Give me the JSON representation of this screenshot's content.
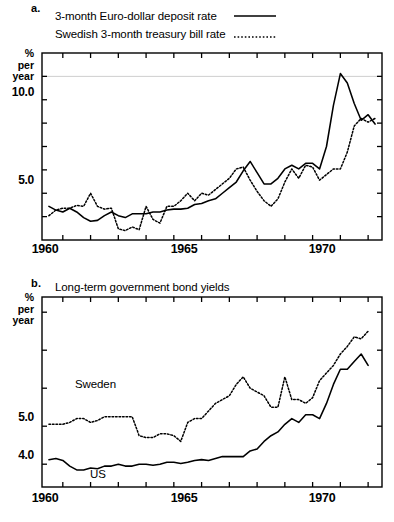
{
  "figure": {
    "panels": [
      {
        "letter": "a.",
        "axis_title_lines": [
          "%",
          "per",
          "year"
        ],
        "legend": [
          {
            "label": "3-month Euro-dollar deposit rate",
            "style": "solid"
          },
          {
            "label": "Swedish 3-month treasury bill rate",
            "style": "dotted"
          }
        ],
        "ytick_labels": [
          "10.0",
          "5.0"
        ],
        "xtick_labels": [
          "1960",
          "1965",
          "1970"
        ]
      },
      {
        "letter": "b.",
        "title": "Long-term government bond yields",
        "axis_title_lines": [
          "%",
          "per",
          "year"
        ],
        "annotations": [
          {
            "label": "Sweden"
          },
          {
            "label": "US"
          }
        ],
        "ytick_labels": [
          "5.0",
          "4.0"
        ],
        "xtick_labels": [
          "1960",
          "1965",
          "1970"
        ]
      }
    ]
  },
  "chart_data": [
    {
      "type": "line",
      "panel": "a",
      "title": "Short-term interest rates",
      "xlabel": "",
      "ylabel": "% per year",
      "xlim": [
        1959.25,
        1971.5
      ],
      "ylim": [
        2.5,
        12.5
      ],
      "yticks": [
        3.75,
        5.0,
        6.25,
        7.5,
        8.75,
        10.0,
        11.25
      ],
      "ytick_labels": {
        "10.0": 10.0,
        "5.0": 5.0
      },
      "xticks": [
        1960,
        1961,
        1962,
        1963,
        1964,
        1965,
        1966,
        1967,
        1968,
        1969,
        1970,
        1971
      ],
      "grid": "single horizontal gridline at 11.25",
      "legend_position": "above-plot",
      "series": [
        {
          "name": "3-month Euro-dollar deposit rate",
          "style": "solid",
          "x": [
            1959.5,
            1959.75,
            1960.0,
            1960.25,
            1960.5,
            1960.75,
            1961.0,
            1961.25,
            1961.5,
            1961.75,
            1962.0,
            1962.25,
            1962.5,
            1962.75,
            1963.0,
            1963.25,
            1963.5,
            1963.75,
            1964.0,
            1964.25,
            1964.5,
            1964.75,
            1965.0,
            1965.25,
            1965.5,
            1965.75,
            1966.0,
            1966.25,
            1966.5,
            1966.75,
            1967.0,
            1967.25,
            1967.5,
            1967.75,
            1968.0,
            1968.25,
            1968.5,
            1968.75,
            1969.0,
            1969.25,
            1969.5,
            1969.75,
            1970.0,
            1970.25,
            1970.5,
            1970.75,
            1971.0,
            1971.25
          ],
          "y": [
            4.3,
            4.1,
            4.0,
            4.2,
            4.0,
            3.7,
            3.5,
            3.55,
            3.8,
            4.0,
            3.8,
            3.7,
            3.9,
            3.9,
            3.9,
            4.0,
            4.0,
            4.1,
            4.15,
            4.15,
            4.2,
            4.4,
            4.45,
            4.6,
            4.7,
            5.0,
            5.3,
            5.6,
            6.2,
            6.7,
            6.1,
            5.5,
            5.5,
            5.8,
            6.3,
            6.5,
            6.3,
            6.6,
            6.6,
            6.3,
            7.5,
            9.7,
            11.4,
            10.9,
            9.8,
            8.9,
            9.2,
            8.7,
            8.9,
            7.0
          ]
        },
        {
          "name": "Swedish 3-month treasury bill rate",
          "style": "dotted",
          "x": [
            1959.5,
            1959.75,
            1960.0,
            1960.25,
            1960.5,
            1960.75,
            1961.0,
            1961.25,
            1961.5,
            1961.75,
            1962.0,
            1962.25,
            1962.5,
            1962.75,
            1963.0,
            1963.25,
            1963.5,
            1963.75,
            1964.0,
            1964.25,
            1964.5,
            1964.75,
            1965.0,
            1965.25,
            1965.5,
            1965.75,
            1966.0,
            1966.25,
            1966.5,
            1966.75,
            1967.0,
            1967.25,
            1967.5,
            1967.75,
            1968.0,
            1968.25,
            1968.5,
            1968.75,
            1969.0,
            1969.25,
            1969.5,
            1969.75,
            1970.0,
            1970.25,
            1970.5,
            1970.75,
            1971.0,
            1971.25
          ],
          "y": [
            3.8,
            4.1,
            4.2,
            4.2,
            4.35,
            4.3,
            5.0,
            4.3,
            4.15,
            4.2,
            3.1,
            3.0,
            3.2,
            3.05,
            4.3,
            3.6,
            3.4,
            4.3,
            4.3,
            4.6,
            5.0,
            4.6,
            5.0,
            4.9,
            5.2,
            5.5,
            5.8,
            6.3,
            6.4,
            5.7,
            5.1,
            4.6,
            4.3,
            4.7,
            5.6,
            6.3,
            5.8,
            6.5,
            6.4,
            5.7,
            6.0,
            6.3,
            6.3,
            7.2,
            8.6,
            9.0,
            8.8,
            9.0,
            8.9
          ]
        }
      ]
    },
    {
      "type": "line",
      "panel": "b",
      "title": "Long-term government bond yields",
      "xlabel": "",
      "ylabel": "% per year",
      "xlim": [
        1959.25,
        1971.5
      ],
      "ylim": [
        3.4,
        8.4
      ],
      "yticks": [
        4.0,
        5.0,
        6.0,
        7.0,
        8.0
      ],
      "ytick_labels": {
        "5.0": 5.0,
        "4.0": 4.0
      },
      "xticks": [
        1960,
        1961,
        1962,
        1963,
        1964,
        1965,
        1966,
        1967,
        1968,
        1969,
        1970,
        1971
      ],
      "grid": "none",
      "legend_position": "inline-annotations",
      "series": [
        {
          "name": "Sweden",
          "style": "dotted",
          "x": [
            1959.5,
            1959.75,
            1960.0,
            1960.25,
            1960.5,
            1960.75,
            1961.0,
            1961.25,
            1961.5,
            1961.75,
            1962.0,
            1962.25,
            1962.5,
            1962.75,
            1963.0,
            1963.25,
            1963.5,
            1963.75,
            1964.0,
            1964.25,
            1964.5,
            1964.75,
            1965.0,
            1965.25,
            1965.5,
            1965.75,
            1966.0,
            1966.25,
            1966.5,
            1966.75,
            1967.0,
            1967.25,
            1967.5,
            1967.75,
            1968.0,
            1968.25,
            1968.5,
            1968.75,
            1969.0,
            1969.25,
            1969.5,
            1969.75,
            1970.0,
            1970.25,
            1970.5,
            1970.75,
            1971.0
          ],
          "y": [
            5.05,
            5.05,
            5.05,
            5.1,
            5.2,
            5.2,
            5.1,
            5.15,
            5.25,
            5.25,
            5.25,
            5.25,
            5.25,
            4.75,
            4.7,
            4.7,
            4.8,
            4.8,
            4.75,
            4.6,
            5.1,
            5.2,
            5.2,
            5.4,
            5.6,
            5.7,
            5.8,
            6.1,
            6.3,
            6.0,
            5.9,
            5.8,
            5.5,
            5.5,
            6.3,
            5.7,
            5.7,
            5.6,
            5.75,
            6.2,
            6.4,
            6.6,
            6.9,
            7.1,
            7.35,
            7.3,
            7.5
          ]
        },
        {
          "name": "US",
          "style": "solid",
          "x": [
            1959.5,
            1959.75,
            1960.0,
            1960.25,
            1960.5,
            1960.75,
            1961.0,
            1961.25,
            1961.5,
            1961.75,
            1962.0,
            1962.25,
            1962.5,
            1962.75,
            1963.0,
            1963.25,
            1963.5,
            1963.75,
            1964.0,
            1964.25,
            1964.5,
            1964.75,
            1965.0,
            1965.25,
            1965.5,
            1965.75,
            1966.0,
            1966.25,
            1966.5,
            1966.75,
            1967.0,
            1967.25,
            1967.5,
            1967.75,
            1968.0,
            1968.25,
            1968.5,
            1968.75,
            1969.0,
            1969.25,
            1969.5,
            1969.75,
            1970.0,
            1970.25,
            1970.5,
            1970.75,
            1971.0
          ],
          "y": [
            4.12,
            4.15,
            4.1,
            3.95,
            3.85,
            3.85,
            3.9,
            3.88,
            3.95,
            3.95,
            4.0,
            3.95,
            3.95,
            4.0,
            4.0,
            3.97,
            4.0,
            4.05,
            4.05,
            4.02,
            4.05,
            4.1,
            4.12,
            4.1,
            4.15,
            4.2,
            4.2,
            4.2,
            4.2,
            4.35,
            4.4,
            4.6,
            4.75,
            4.85,
            5.05,
            5.2,
            5.1,
            5.3,
            5.3,
            5.2,
            5.6,
            6.1,
            6.5,
            6.5,
            6.7,
            6.9,
            6.6
          ]
        }
      ]
    }
  ]
}
